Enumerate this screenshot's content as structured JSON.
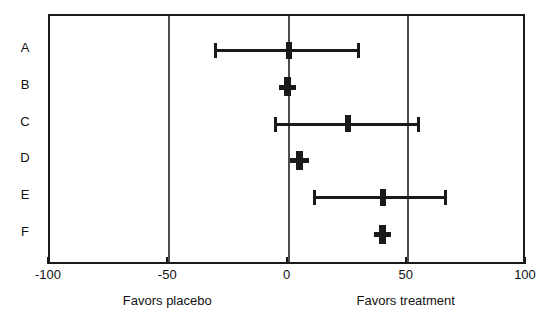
{
  "chart_data": {
    "type": "scatter",
    "subtype": "forest-plot",
    "title": "",
    "xlabel": "",
    "ylabel": "",
    "xlim": [
      -100,
      100
    ],
    "xticks": [
      -100,
      -50,
      0,
      50,
      100
    ],
    "xtick_labels": [
      "-100",
      "-50",
      "0",
      "50",
      "100"
    ],
    "grid": false,
    "reference_lines": [
      -50,
      0,
      50
    ],
    "categories": [
      "A",
      "B",
      "C",
      "D",
      "E",
      "F"
    ],
    "annotations": [
      {
        "text": "Favors placebo",
        "x": -50
      },
      {
        "text": "Favors treatment",
        "x": 50
      }
    ],
    "rows": [
      {
        "label": "A",
        "estimate": 0,
        "ci_low": -31,
        "ci_high": 29
      },
      {
        "label": "B",
        "estimate": -0.5,
        "ci_low": -4,
        "ci_high": 3
      },
      {
        "label": "C",
        "estimate": 25,
        "ci_low": -5.5,
        "ci_high": 54.5
      },
      {
        "label": "D",
        "estimate": 4.5,
        "ci_low": 0.5,
        "ci_high": 8.5
      },
      {
        "label": "E",
        "estimate": 39.5,
        "ci_low": 10.5,
        "ci_high": 65.5
      },
      {
        "label": "F",
        "estimate": 39.5,
        "ci_low": 36,
        "ci_high": 43
      }
    ]
  },
  "axis": {
    "tick_labels": [
      "-100",
      "-50",
      "0",
      "50",
      "100"
    ],
    "favors_placebo": "Favors placebo",
    "favors_treatment": "Favors treatment"
  },
  "study_labels": [
    "A",
    "B",
    "C",
    "D",
    "E",
    "F"
  ],
  "colors": {
    "line": "#1a1a1a",
    "reference": "#4d4d4d",
    "background": "#ffffff",
    "text": "#111111"
  }
}
